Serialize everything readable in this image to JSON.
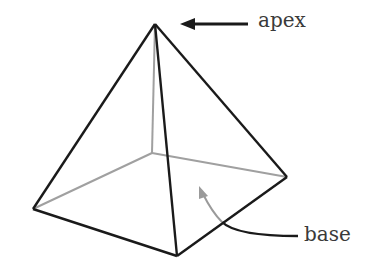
{
  "diagram": {
    "labels": {
      "apex": "apex",
      "base": "base"
    },
    "colors": {
      "visible_edge": "#1a1a1a",
      "hidden_edge": "#9a9a9a",
      "label_text": "#3a3a3a"
    }
  }
}
